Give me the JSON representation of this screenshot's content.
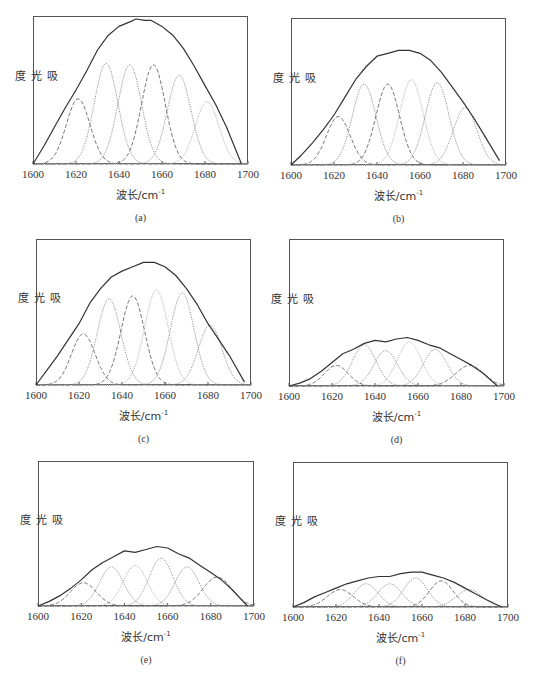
{
  "figure": {
    "ylabel": "吸光度",
    "xlabel_prefix": "波长/cm",
    "xlabel_sup": "-1",
    "x_ticks": [
      "1600",
      "1620",
      "1640",
      "1660",
      "1680",
      "1700"
    ]
  },
  "panels_layout": [
    {
      "id": "a",
      "frame": [
        33,
        16,
        248,
        164
      ]
    },
    {
      "id": "b",
      "frame": [
        291,
        18,
        506,
        165
      ]
    },
    {
      "id": "c",
      "frame": [
        36,
        239,
        251,
        385
      ]
    },
    {
      "id": "d",
      "frame": [
        289,
        239,
        504,
        386
      ]
    },
    {
      "id": "e",
      "frame": [
        38,
        461,
        254,
        606
      ]
    },
    {
      "id": "f",
      "frame": [
        293,
        462,
        508,
        607
      ]
    }
  ],
  "chart_data": [
    {
      "type": "line",
      "panel": "(a)",
      "title": "",
      "xlabel": "波长/cm-1",
      "ylabel": "吸光度",
      "xlim": [
        1600,
        1700
      ],
      "ylim": [
        0,
        1
      ],
      "x_ticks": [
        1600,
        1620,
        1640,
        1660,
        1680,
        1700
      ],
      "grid": false,
      "legend": "none",
      "envelope_peak": 0.98,
      "envelope": [
        [
          1600,
          0
        ],
        [
          1605,
          0.12
        ],
        [
          1610,
          0.25
        ],
        [
          1615,
          0.38
        ],
        [
          1620,
          0.5
        ],
        [
          1625,
          0.63
        ],
        [
          1630,
          0.77
        ],
        [
          1635,
          0.87
        ],
        [
          1640,
          0.93
        ],
        [
          1645,
          0.96
        ],
        [
          1648,
          0.98
        ],
        [
          1652,
          0.97
        ],
        [
          1655,
          0.97
        ],
        [
          1660,
          0.93
        ],
        [
          1665,
          0.87
        ],
        [
          1670,
          0.78
        ],
        [
          1675,
          0.66
        ],
        [
          1680,
          0.53
        ],
        [
          1685,
          0.4
        ],
        [
          1690,
          0.25
        ],
        [
          1697,
          0
        ]
      ],
      "series": [
        {
          "name": "band 1620",
          "center": 1621,
          "amplitude": 0.44,
          "sigma": 5.5,
          "style": "dashed"
        },
        {
          "name": "band 1634",
          "center": 1634,
          "amplitude": 0.68,
          "sigma": 5.5,
          "style": "dotted"
        },
        {
          "name": "band 1645",
          "center": 1645,
          "amplitude": 0.67,
          "sigma": 5.5,
          "style": "dotted"
        },
        {
          "name": "band 1656",
          "center": 1656,
          "amplitude": 0.67,
          "sigma": 5.5,
          "style": "dashed"
        },
        {
          "name": "band 1668",
          "center": 1668,
          "amplitude": 0.6,
          "sigma": 5.5,
          "style": "dotted"
        },
        {
          "name": "band 1681",
          "center": 1681,
          "amplitude": 0.42,
          "sigma": 5.5,
          "style": "dotted-light"
        }
      ]
    },
    {
      "type": "line",
      "panel": "(b)",
      "title": "",
      "xlabel": "波长/cm-1",
      "ylabel": "吸光度",
      "xlim": [
        1600,
        1700
      ],
      "ylim": [
        0,
        1
      ],
      "x_ticks": [
        1600,
        1620,
        1640,
        1660,
        1680,
        1700
      ],
      "grid": false,
      "legend": "none",
      "envelope_peak": 0.78,
      "envelope": [
        [
          1600,
          0
        ],
        [
          1605,
          0.07
        ],
        [
          1610,
          0.15
        ],
        [
          1615,
          0.24
        ],
        [
          1620,
          0.34
        ],
        [
          1625,
          0.46
        ],
        [
          1630,
          0.58
        ],
        [
          1635,
          0.67
        ],
        [
          1640,
          0.74
        ],
        [
          1645,
          0.76
        ],
        [
          1650,
          0.78
        ],
        [
          1655,
          0.78
        ],
        [
          1660,
          0.76
        ],
        [
          1665,
          0.71
        ],
        [
          1670,
          0.63
        ],
        [
          1675,
          0.53
        ],
        [
          1680,
          0.43
        ],
        [
          1685,
          0.32
        ],
        [
          1690,
          0.2
        ],
        [
          1697,
          0.03
        ]
      ],
      "series": [
        {
          "name": "band 1622",
          "center": 1622,
          "amplitude": 0.33,
          "sigma": 5.5,
          "style": "dashed"
        },
        {
          "name": "band 1634",
          "center": 1634,
          "amplitude": 0.55,
          "sigma": 5.5,
          "style": "dotted"
        },
        {
          "name": "band 1645",
          "center": 1645,
          "amplitude": 0.55,
          "sigma": 5.5,
          "style": "dashed"
        },
        {
          "name": "band 1656",
          "center": 1656,
          "amplitude": 0.58,
          "sigma": 5.5,
          "style": "dotted-light"
        },
        {
          "name": "band 1668",
          "center": 1668,
          "amplitude": 0.56,
          "sigma": 5.5,
          "style": "dotted"
        },
        {
          "name": "band 1681",
          "center": 1681,
          "amplitude": 0.39,
          "sigma": 5.5,
          "style": "dotted"
        }
      ]
    },
    {
      "type": "line",
      "panel": "(c)",
      "title": "",
      "xlabel": "波长/cm-1",
      "ylabel": "吸光度",
      "xlim": [
        1600,
        1700
      ],
      "ylim": [
        0,
        1
      ],
      "x_ticks": [
        1600,
        1620,
        1640,
        1660,
        1680,
        1700
      ],
      "grid": false,
      "legend": "none",
      "envelope_peak": 0.84,
      "envelope": [
        [
          1600,
          0
        ],
        [
          1605,
          0.1
        ],
        [
          1610,
          0.2
        ],
        [
          1615,
          0.31
        ],
        [
          1620,
          0.42
        ],
        [
          1625,
          0.56
        ],
        [
          1630,
          0.66
        ],
        [
          1635,
          0.74
        ],
        [
          1640,
          0.78
        ],
        [
          1645,
          0.81
        ],
        [
          1650,
          0.84
        ],
        [
          1655,
          0.84
        ],
        [
          1660,
          0.81
        ],
        [
          1665,
          0.75
        ],
        [
          1670,
          0.66
        ],
        [
          1675,
          0.55
        ],
        [
          1680,
          0.42
        ],
        [
          1685,
          0.31
        ],
        [
          1690,
          0.2
        ],
        [
          1697,
          0.02
        ]
      ],
      "series": [
        {
          "name": "band 1622",
          "center": 1622,
          "amplitude": 0.35,
          "sigma": 5.5,
          "style": "dashed"
        },
        {
          "name": "band 1634",
          "center": 1634,
          "amplitude": 0.59,
          "sigma": 5.5,
          "style": "dotted"
        },
        {
          "name": "band 1645",
          "center": 1645,
          "amplitude": 0.61,
          "sigma": 5.5,
          "style": "dashed"
        },
        {
          "name": "band 1656",
          "center": 1656,
          "amplitude": 0.65,
          "sigma": 5.5,
          "style": "dotted-light"
        },
        {
          "name": "band 1668",
          "center": 1668,
          "amplitude": 0.63,
          "sigma": 5.5,
          "style": "dotted"
        },
        {
          "name": "band 1681",
          "center": 1681,
          "amplitude": 0.41,
          "sigma": 5.5,
          "style": "dotted"
        }
      ]
    },
    {
      "type": "line",
      "panel": "(d)",
      "title": "",
      "xlabel": "波长/cm-1",
      "ylabel": "吸光度",
      "xlim": [
        1600,
        1700
      ],
      "ylim": [
        0,
        1
      ],
      "x_ticks": [
        1600,
        1620,
        1640,
        1660,
        1680,
        1700
      ],
      "grid": false,
      "legend": "none",
      "envelope_peak": 0.33,
      "envelope": [
        [
          1600,
          0
        ],
        [
          1605,
          0.02
        ],
        [
          1610,
          0.05
        ],
        [
          1615,
          0.1
        ],
        [
          1620,
          0.16
        ],
        [
          1625,
          0.22
        ],
        [
          1630,
          0.25
        ],
        [
          1635,
          0.29
        ],
        [
          1640,
          0.31
        ],
        [
          1645,
          0.3
        ],
        [
          1650,
          0.32
        ],
        [
          1655,
          0.33
        ],
        [
          1660,
          0.31
        ],
        [
          1665,
          0.28
        ],
        [
          1670,
          0.26
        ],
        [
          1675,
          0.22
        ],
        [
          1680,
          0.18
        ],
        [
          1685,
          0.14
        ],
        [
          1690,
          0.09
        ],
        [
          1697,
          0
        ]
      ],
      "series": [
        {
          "name": "band 1622",
          "center": 1622,
          "amplitude": 0.14,
          "sigma": 5.5,
          "style": "dashed"
        },
        {
          "name": "band 1635",
          "center": 1635,
          "amplitude": 0.28,
          "sigma": 5.5,
          "style": "dotted"
        },
        {
          "name": "band 1645",
          "center": 1645,
          "amplitude": 0.24,
          "sigma": 5.5,
          "style": "dotted"
        },
        {
          "name": "band 1656",
          "center": 1656,
          "amplitude": 0.3,
          "sigma": 5.5,
          "style": "dotted-light"
        },
        {
          "name": "band 1668",
          "center": 1668,
          "amplitude": 0.25,
          "sigma": 5.5,
          "style": "dotted"
        },
        {
          "name": "band 1684",
          "center": 1684,
          "amplitude": 0.14,
          "sigma": 6.5,
          "style": "dashed"
        }
      ]
    },
    {
      "type": "line",
      "panel": "(e)",
      "title": "",
      "xlabel": "波长/cm-1",
      "ylabel": "吸光度",
      "xlim": [
        1600,
        1700
      ],
      "ylim": [
        0,
        1
      ],
      "x_ticks": [
        1600,
        1620,
        1640,
        1660,
        1680,
        1700
      ],
      "grid": false,
      "legend": "none",
      "envelope_peak": 0.41,
      "envelope": [
        [
          1600,
          0
        ],
        [
          1605,
          0.03
        ],
        [
          1610,
          0.07
        ],
        [
          1615,
          0.12
        ],
        [
          1620,
          0.18
        ],
        [
          1625,
          0.25
        ],
        [
          1630,
          0.3
        ],
        [
          1635,
          0.34
        ],
        [
          1640,
          0.38
        ],
        [
          1645,
          0.37
        ],
        [
          1650,
          0.39
        ],
        [
          1655,
          0.41
        ],
        [
          1660,
          0.4
        ],
        [
          1665,
          0.36
        ],
        [
          1670,
          0.33
        ],
        [
          1675,
          0.28
        ],
        [
          1680,
          0.23
        ],
        [
          1685,
          0.18
        ],
        [
          1690,
          0.11
        ],
        [
          1697,
          0
        ]
      ],
      "series": [
        {
          "name": "band 1621",
          "center": 1621,
          "amplitude": 0.16,
          "sigma": 6,
          "style": "dashed"
        },
        {
          "name": "band 1634",
          "center": 1634,
          "amplitude": 0.27,
          "sigma": 5.5,
          "style": "dotted"
        },
        {
          "name": "band 1645",
          "center": 1645,
          "amplitude": 0.28,
          "sigma": 5.5,
          "style": "dotted-light"
        },
        {
          "name": "band 1657",
          "center": 1657,
          "amplitude": 0.33,
          "sigma": 5.5,
          "style": "dotted"
        },
        {
          "name": "band 1669",
          "center": 1669,
          "amplitude": 0.27,
          "sigma": 5.5,
          "style": "dotted"
        },
        {
          "name": "band 1683",
          "center": 1683,
          "amplitude": 0.2,
          "sigma": 6.5,
          "style": "dashed"
        }
      ]
    },
    {
      "type": "line",
      "panel": "(f)",
      "title": "",
      "xlabel": "波长/cm-1",
      "ylabel": "吸光度",
      "xlim": [
        1600,
        1700
      ],
      "ylim": [
        0,
        1
      ],
      "x_ticks": [
        1600,
        1620,
        1640,
        1660,
        1680,
        1700
      ],
      "grid": false,
      "legend": "none",
      "envelope_peak": 0.24,
      "envelope": [
        [
          1600,
          0
        ],
        [
          1605,
          0.03
        ],
        [
          1610,
          0.07
        ],
        [
          1615,
          0.1
        ],
        [
          1620,
          0.13
        ],
        [
          1625,
          0.16
        ],
        [
          1630,
          0.18
        ],
        [
          1635,
          0.2
        ],
        [
          1640,
          0.21
        ],
        [
          1645,
          0.21
        ],
        [
          1650,
          0.23
        ],
        [
          1655,
          0.24
        ],
        [
          1660,
          0.24
        ],
        [
          1665,
          0.22
        ],
        [
          1670,
          0.2
        ],
        [
          1675,
          0.17
        ],
        [
          1680,
          0.13
        ],
        [
          1685,
          0.09
        ],
        [
          1690,
          0.05
        ],
        [
          1697,
          0
        ]
      ],
      "series": [
        {
          "name": "band 1622",
          "center": 1622,
          "amplitude": 0.12,
          "sigma": 6,
          "style": "dashed"
        },
        {
          "name": "band 1634",
          "center": 1634,
          "amplitude": 0.16,
          "sigma": 5.5,
          "style": "dotted"
        },
        {
          "name": "band 1645",
          "center": 1645,
          "amplitude": 0.16,
          "sigma": 5.5,
          "style": "dotted"
        },
        {
          "name": "band 1657",
          "center": 1657,
          "amplitude": 0.2,
          "sigma": 5.5,
          "style": "dotted"
        },
        {
          "name": "band 1669",
          "center": 1669,
          "amplitude": 0.18,
          "sigma": 5.5,
          "style": "dashed"
        },
        {
          "name": "band 1682",
          "center": 1682,
          "amplitude": 0.12,
          "sigma": 6,
          "style": "dotted"
        }
      ]
    }
  ],
  "captions": [
    "(a)",
    "(b)",
    "(c)",
    "(d)",
    "(e)",
    "(f)"
  ],
  "colors": {
    "envelope": "#333333",
    "dashed": "#666666",
    "dotted": "#888888",
    "dotted-light": "#aaaaaa",
    "frame": "#555555"
  }
}
